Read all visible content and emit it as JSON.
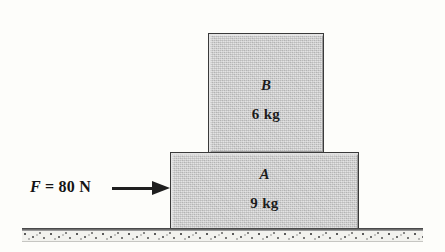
{
  "diagram": {
    "background_color": "#fdfdfa",
    "block_fill_color": "#c9c9c9",
    "block_border_color": "#3a3a3a",
    "ink_color": "#1c1c1c"
  },
  "blocks": [
    {
      "id": "block-b",
      "name": "B",
      "mass": "6 kg",
      "position": "top"
    },
    {
      "id": "block-a",
      "name": "A",
      "mass": "9 kg",
      "position": "bottom"
    }
  ],
  "force": {
    "symbol": "F",
    "expression": " = 80 N",
    "full_label": "F = 80 N",
    "magnitude": 80,
    "unit": "N",
    "direction": "right",
    "applied_to": "A"
  },
  "ground": {
    "label": "ground-surface",
    "style": "hatched"
  }
}
